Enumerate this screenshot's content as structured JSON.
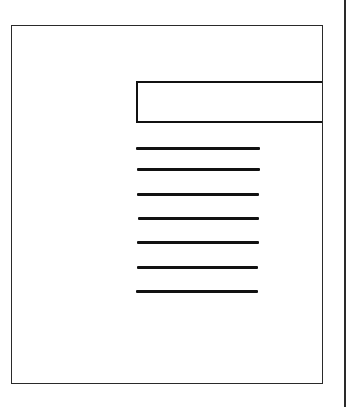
{
  "diagram": {
    "type": "document-layout-figure",
    "colors": {
      "background": "#ffffff",
      "stroke": "#111111",
      "outline": "#2a2a2a"
    },
    "page_outline": {
      "x": 11,
      "y": 25,
      "width": 310,
      "height": 357
    },
    "header_box": {
      "x": 136,
      "y": 81,
      "width": 186,
      "height": 42,
      "open_side": "right"
    },
    "text_lines": [
      {
        "x": 136,
        "y": 147,
        "width": 124
      },
      {
        "x": 137,
        "y": 168,
        "width": 123
      },
      {
        "x": 137,
        "y": 193,
        "width": 122
      },
      {
        "x": 138,
        "y": 217,
        "width": 121
      },
      {
        "x": 137,
        "y": 241,
        "width": 122
      },
      {
        "x": 137,
        "y": 266,
        "width": 121
      },
      {
        "x": 136,
        "y": 290,
        "width": 122
      }
    ],
    "edge_line": {
      "x": 344
    }
  }
}
